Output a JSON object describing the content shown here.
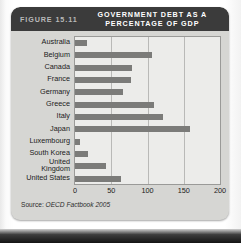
{
  "figure": {
    "number": "FIGURE 15.11",
    "title_line1": "GOVERNMENT DEBT AS A",
    "title_line2": "PERCENTAGE OF GDP",
    "source_lead": "Source:",
    "source_text": "OECD Factbook 2005"
  },
  "colors": {
    "header_bg": "#3b3b3b",
    "card_bg": "#d6d6d3",
    "plot_bg": "#ececea",
    "bar": "#7b7b79",
    "grid": "#b9b9b7",
    "axis_text": "#1b1b1b"
  },
  "chart_data": {
    "type": "bar",
    "orientation": "horizontal",
    "title": "GOVERNMENT DEBT AS A PERCENTAGE OF GDP",
    "xlabel": "",
    "ylabel": "",
    "xlim": [
      0,
      200
    ],
    "xticks": [
      0,
      50,
      100,
      150,
      200
    ],
    "grid": true,
    "legend": false,
    "source": "Source: OECD Factbook 2005",
    "categories": [
      "Australia",
      "Belgium",
      "Canada",
      "France",
      "Germany",
      "Greece",
      "Italy",
      "Japan",
      "Luxembourg",
      "South Korea",
      "United Kingdom",
      "United States"
    ],
    "category_lines": [
      [
        "Australia"
      ],
      [
        "Belgium"
      ],
      [
        "Canada"
      ],
      [
        "France"
      ],
      [
        "Germany"
      ],
      [
        "Greece"
      ],
      [
        "Italy"
      ],
      [
        "Japan"
      ],
      [
        "Luxembourg"
      ],
      [
        "South Korea"
      ],
      [
        "United",
        "Kingdom"
      ],
      [
        "United States"
      ]
    ],
    "values": [
      17,
      106,
      78,
      77,
      66,
      109,
      122,
      159,
      7,
      18,
      43,
      64
    ]
  }
}
